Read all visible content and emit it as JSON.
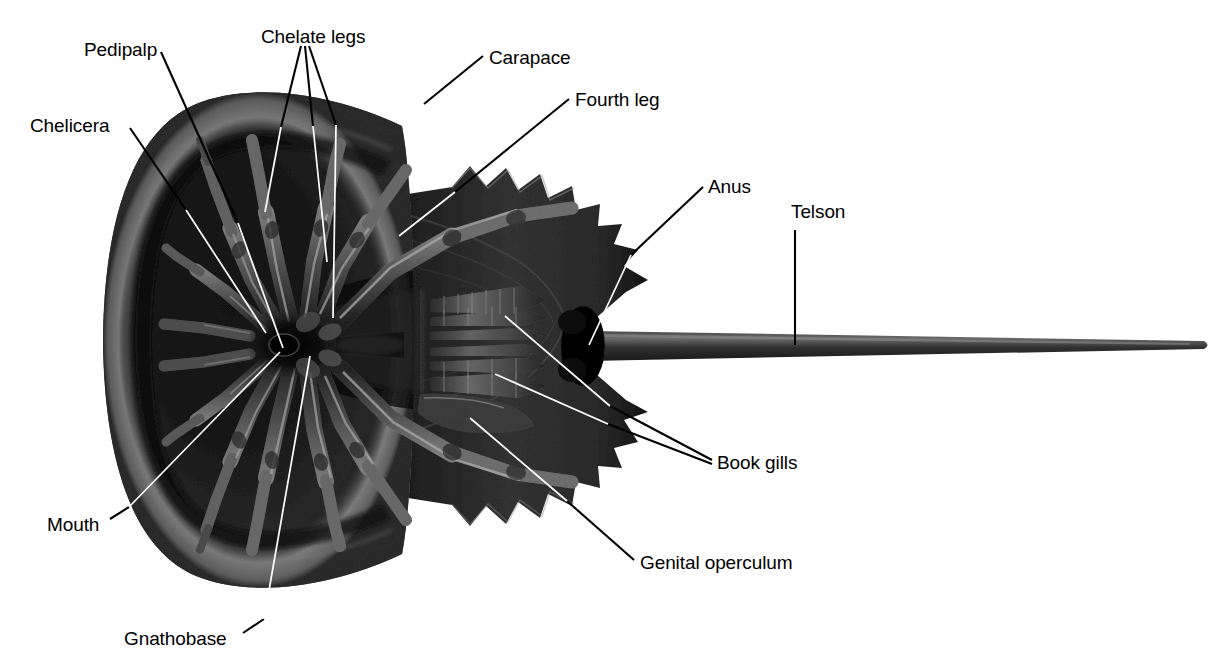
{
  "figure": {
    "background_color": "#ffffff",
    "label_color": "#000000",
    "leader_line_outside_color": "#000000",
    "leader_line_inside_color": "#ffffff",
    "body_color_dark": "#1a1a1a",
    "body_color_mid": "#3a3a3a",
    "body_color_light": "#6e6e6e"
  },
  "labels": [
    {
      "id": "pedipalp",
      "text": "Pedipalp",
      "x": 84,
      "y": 40,
      "align": "left"
    },
    {
      "id": "chelate-legs",
      "text": "Chelate legs",
      "x": 261,
      "y": 27,
      "align": "left"
    },
    {
      "id": "carapace",
      "text": "Carapace",
      "x": 489,
      "y": 48,
      "align": "left"
    },
    {
      "id": "fourth-leg",
      "text": "Fourth leg",
      "x": 575,
      "y": 90,
      "align": "left"
    },
    {
      "id": "chelicera",
      "text": "Chelicera",
      "x": 30,
      "y": 116,
      "align": "left"
    },
    {
      "id": "anus",
      "text": "Anus",
      "x": 708,
      "y": 177,
      "align": "left"
    },
    {
      "id": "telson",
      "text": "Telson",
      "x": 791,
      "y": 202,
      "align": "left"
    },
    {
      "id": "book-gills",
      "text": "Book gills",
      "x": 717,
      "y": 453,
      "align": "left"
    },
    {
      "id": "mouth",
      "text": "Mouth",
      "x": 47,
      "y": 515,
      "align": "left"
    },
    {
      "id": "genital-operculum",
      "text": "Genital operculum",
      "x": 640,
      "y": 553,
      "align": "left"
    },
    {
      "id": "gnathobase",
      "text": "Gnathobase",
      "x": 124,
      "y": 629,
      "align": "left"
    }
  ],
  "leaders": [
    {
      "id": "pedipalp-leader",
      "label": "Pedipalp",
      "outside": "M161,52 L238,223",
      "inside": "M238,223 L283,348"
    },
    {
      "id": "chelate-legs-leader-a",
      "label": "Chelate legs",
      "outside": "M301,46 L281,127",
      "inside": "M281,127 L265,212"
    },
    {
      "id": "chelate-legs-leader-b",
      "label": "Chelate legs",
      "outside": "M305,46 L313,126",
      "inside": "M313,126 L327,262"
    },
    {
      "id": "chelate-legs-leader-c",
      "label": "Chelate legs",
      "outside": "M309,46 L336,125",
      "inside": "M336,125 L333,318"
    },
    {
      "id": "carapace-leader",
      "label": "Carapace",
      "outside": "M483,56 L424,104",
      "inside": ""
    },
    {
      "id": "fourth-leg-leader",
      "label": "Fourth leg",
      "outside": "M569,99 L455,192",
      "inside": "M455,192 L399,236"
    },
    {
      "id": "chelicera-leader",
      "label": "Chelicera",
      "outside": "M130,128 L186,210",
      "inside": "M186,210 L266,333"
    },
    {
      "id": "anus-leader",
      "label": "Anus",
      "outside": "M703,187 L631,255",
      "inside": "M631,255 L589,345"
    },
    {
      "id": "telson-leader",
      "label": "Telson",
      "outside": "M795,230 L795,345",
      "inside": ""
    },
    {
      "id": "book-gills-leader-a",
      "label": "Book gills",
      "outside": "M712,460 L610,406",
      "inside": "M610,406 L505,316"
    },
    {
      "id": "book-gills-leader-b",
      "label": "Book gills",
      "outside": "M712,464 L608,424",
      "inside": "M608,424 L495,374"
    },
    {
      "id": "mouth-leader",
      "label": "Mouth",
      "outside": "M110,519 L129,507",
      "inside": "M129,507 L280,352"
    },
    {
      "id": "genital-operculum-leader",
      "label": "Genital operculum",
      "outside": "M634,560 L567,501",
      "inside": "M567,501 L470,418"
    },
    {
      "id": "gnathobase-leader",
      "label": "Gnathobase",
      "outside": "M243,633 L264,619",
      "inside": "M264,619 L310,356"
    }
  ],
  "anatomy_parts": [
    "carapace (prosoma)",
    "opisthosoma (abdomen) with marginal spines",
    "telson (tail spine)",
    "chelicera",
    "pedipalp",
    "chelate legs",
    "fourth leg",
    "gnathobase",
    "mouth",
    "genital operculum",
    "book gills",
    "anus"
  ]
}
